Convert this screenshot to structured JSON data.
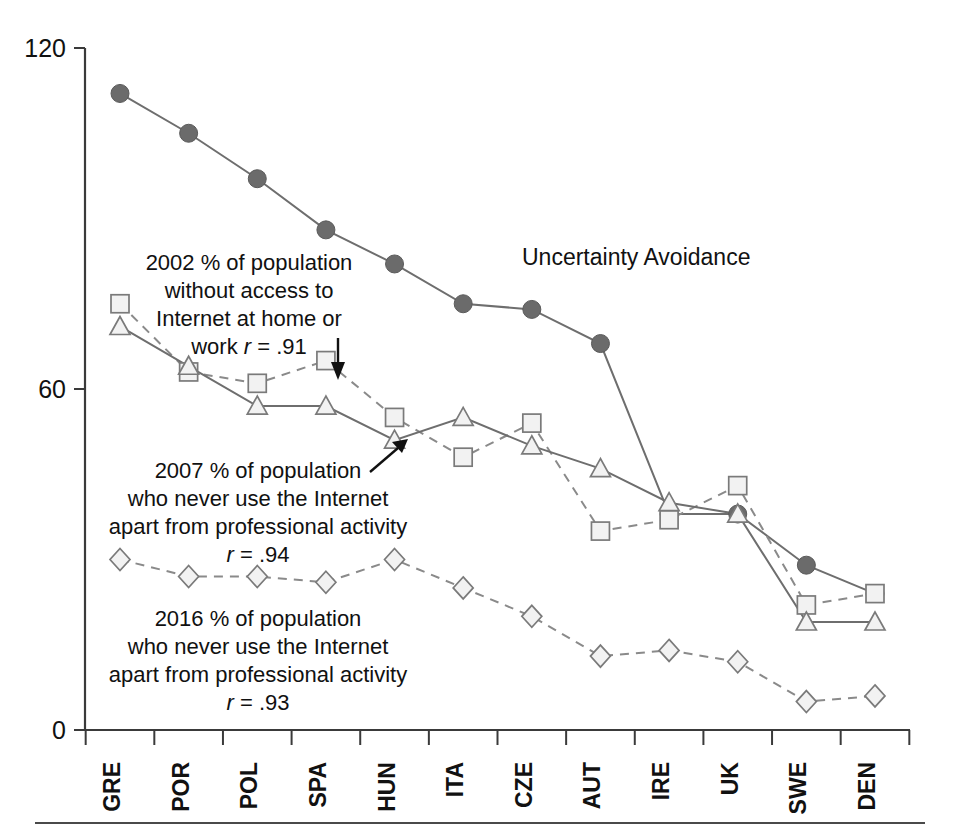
{
  "chart_data": {
    "type": "line",
    "title": "",
    "xlabel": "",
    "ylabel": "",
    "ylim": [
      0,
      120
    ],
    "yticks": [
      0,
      60,
      120
    ],
    "ytick_labels": [
      "0",
      "60",
      "120"
    ],
    "grid": false,
    "legend": "inline-annotations",
    "categories": [
      "GRE",
      "POR",
      "POL",
      "SPA",
      "HUN",
      "ITA",
      "CZE",
      "AUT",
      "IRE",
      "UK",
      "SWE",
      "DEN"
    ],
    "series": [
      {
        "name": "Uncertainty Avoidance",
        "marker": "filled-circle",
        "line": "solid",
        "values": [
          112,
          105,
          97,
          88,
          82,
          75,
          74,
          68,
          38,
          38,
          29,
          24
        ]
      },
      {
        "name": "2002 % of population without access to Internet at home or work",
        "marker": "open-square",
        "line": "dashed",
        "values": [
          75,
          63,
          61,
          65,
          55,
          48,
          54,
          35,
          37,
          43,
          22,
          24
        ]
      },
      {
        "name": "2007 % of population who never use the Internet apart from professional activity",
        "marker": "open-triangle",
        "line": "solid",
        "values": [
          71,
          64,
          57,
          57,
          51,
          55,
          50,
          46,
          40,
          38,
          19,
          19
        ]
      },
      {
        "name": "2016 % of population who never use the Internet apart from professional activity",
        "marker": "open-diamond",
        "line": "dashed",
        "values": [
          30,
          27,
          27,
          26,
          30,
          25,
          20,
          13,
          14,
          12,
          5,
          6
        ]
      }
    ],
    "annotations": [
      {
        "id": "annot-2002",
        "lines": [
          "2002 % of population",
          "without access to",
          "Internet at home or",
          "work r = .91"
        ],
        "correlation": ".91",
        "correlation_symbol": "r"
      },
      {
        "id": "annot-uncertainty",
        "lines": [
          "Uncertainty Avoidance"
        ]
      },
      {
        "id": "annot-2007",
        "lines": [
          "2007 % of population",
          "who never use the Internet",
          "apart from professional activity",
          "r = .94"
        ],
        "correlation": ".94",
        "correlation_symbol": "r"
      },
      {
        "id": "annot-2016",
        "lines": [
          "2016 % of population",
          "who never use the Internet",
          "apart from professional activity",
          "r = .93"
        ],
        "correlation": ".93",
        "correlation_symbol": "r"
      }
    ]
  },
  "annot_text": {
    "a2002_l1": "2002 % of population",
    "a2002_l2": "without access to",
    "a2002_l3": "Internet at home or",
    "a2002_l4a": "work ",
    "a2002_l4b": "r",
    "a2002_l4c": " = .91",
    "uncertainty": "Uncertainty Avoidance",
    "a2007_l1": "2007 % of population",
    "a2007_l2": "who never use the Internet",
    "a2007_l3": "apart from professional activity",
    "a2007_l4a": "r",
    "a2007_l4b": " = .94",
    "a2016_l1": "2016 % of population",
    "a2016_l2": "who never use the Internet",
    "a2016_l3": "apart from professional activity",
    "a2016_l4a": "r",
    "a2016_l4b": " = .93"
  },
  "axis": {
    "y_labels": [
      "120",
      "60",
      "0"
    ],
    "x_labels": [
      "GRE",
      "POR",
      "POL",
      "SPA",
      "HUN",
      "ITA",
      "CZE",
      "AUT",
      "IRE",
      "UK",
      "SWE",
      "DEN"
    ]
  },
  "colors": {
    "axis": "#3a3a3a",
    "solid_line": "#6e6e6e",
    "dashed_line": "#8a8a8a",
    "filled_marker": "#6b6b6b",
    "open_marker_fill": "#f2f2f2",
    "open_marker_stroke": "#7a7a7a",
    "text": "#111111",
    "background": "#ffffff"
  }
}
